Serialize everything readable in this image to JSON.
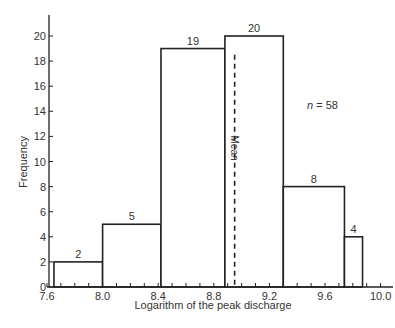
{
  "chart_data": {
    "type": "bar",
    "title": "",
    "xlabel": "Logarithm of the peak discharge",
    "ylabel": "Frequency",
    "xlim": [
      7.6,
      10.15
    ],
    "ylim": [
      0,
      21.5
    ],
    "xticks": [
      "7.6",
      "8.0",
      "8.4",
      "8.8",
      "9.2",
      "9.6",
      "10.0"
    ],
    "yticks": [
      "0",
      "2",
      "4",
      "6",
      "8",
      "10",
      "12",
      "14",
      "16",
      "18",
      "20"
    ],
    "bins": [
      {
        "x0": 7.65,
        "x1": 8.0,
        "value": 2,
        "label": "2"
      },
      {
        "x0": 8.0,
        "x1": 8.42,
        "value": 5,
        "label": "5"
      },
      {
        "x0": 8.42,
        "x1": 8.88,
        "value": 19,
        "label": "19"
      },
      {
        "x0": 8.88,
        "x1": 9.3,
        "value": 20,
        "label": "20"
      },
      {
        "x0": 9.3,
        "x1": 9.74,
        "value": 8,
        "label": "8"
      },
      {
        "x0": 9.74,
        "x1": 9.87,
        "value": 4,
        "label": "4"
      }
    ],
    "annotations": [
      {
        "text": "Mean",
        "x": 8.95,
        "style": "dashed vertical line"
      },
      {
        "text": "n = 58"
      }
    ],
    "grid": false,
    "legend": null
  },
  "labels": {
    "mean": "Mean",
    "n_italic": "n",
    "n_value": " = 58"
  }
}
